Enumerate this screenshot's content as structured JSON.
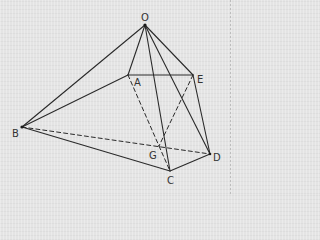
{
  "diagram": {
    "type": "pyramid-geometry",
    "vertices": {
      "O": {
        "label": "O",
        "x": 145,
        "y": 25,
        "lx": 141,
        "ly": 20
      },
      "A": {
        "label": "A",
        "x": 128,
        "y": 75,
        "lx": 134,
        "ly": 86
      },
      "E": {
        "label": "E",
        "x": 193,
        "y": 75,
        "lx": 197,
        "ly": 83
      },
      "B": {
        "label": "B",
        "x": 22,
        "y": 127,
        "lx": 12,
        "ly": 137
      },
      "G": {
        "label": "G",
        "x": 159,
        "y": 146,
        "lx": 149,
        "ly": 159
      },
      "C": {
        "label": "C",
        "x": 170,
        "y": 171,
        "lx": 167,
        "ly": 184
      },
      "D": {
        "label": "D",
        "x": 210,
        "y": 154,
        "lx": 213,
        "ly": 161
      }
    },
    "solid_edges": [
      [
        "O",
        "A"
      ],
      [
        "O",
        "E"
      ],
      [
        "O",
        "B"
      ],
      [
        "O",
        "C"
      ],
      [
        "O",
        "D"
      ],
      [
        "A",
        "E"
      ],
      [
        "A",
        "B"
      ],
      [
        "B",
        "C"
      ],
      [
        "C",
        "D"
      ],
      [
        "E",
        "D"
      ]
    ],
    "dashed_edges": [
      [
        "A",
        "G"
      ],
      [
        "G",
        "C"
      ],
      [
        "E",
        "G"
      ],
      [
        "B",
        "D"
      ]
    ],
    "colors": {
      "line": "#2a2a2a",
      "label": "#333333",
      "background": "#e4e4e4"
    }
  }
}
